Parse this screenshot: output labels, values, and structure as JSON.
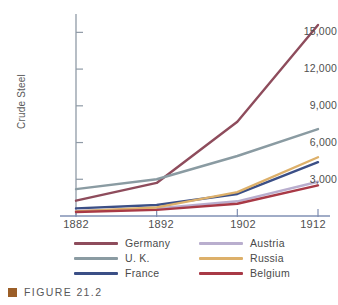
{
  "figure": {
    "caption": "FIGURE 21.2",
    "bullet_color": "#9b5e28"
  },
  "chart_data": {
    "type": "line",
    "title": "",
    "xlabel": "",
    "ylabel": "Crude Steel",
    "x": [
      1882,
      1892,
      1902,
      1912
    ],
    "categories": [
      "1882",
      "1892",
      "1902",
      "1912"
    ],
    "xtick_labels": [
      "1882",
      "1892",
      "1902",
      "1912"
    ],
    "ytick_labels": [
      "3,000",
      "6,000",
      "9,000",
      "12,000",
      "15,000"
    ],
    "ytick_values": [
      3000,
      6000,
      9000,
      12000,
      15000
    ],
    "ylim": [
      0,
      16500
    ],
    "xlim": [
      1882,
      1912
    ],
    "grid": false,
    "legend_position": "below",
    "series": [
      {
        "name": "Germany",
        "color": "#8e4c5c",
        "values": [
          1250,
          2700,
          7700,
          15600
        ]
      },
      {
        "name": "U. K.",
        "color": "#8a9ba2",
        "values": [
          2200,
          3000,
          4900,
          7100
        ]
      },
      {
        "name": "France",
        "color": "#3b4f86",
        "values": [
          620,
          900,
          1800,
          4400
        ]
      },
      {
        "name": "Austria",
        "color": "#b9aece",
        "values": [
          420,
          620,
          1200,
          2800
        ]
      },
      {
        "name": "Russia",
        "color": "#ddb06a",
        "values": [
          380,
          700,
          1950,
          4800
        ]
      },
      {
        "name": "Belgium",
        "color": "#a83946",
        "values": [
          330,
          500,
          1000,
          2500
        ]
      }
    ]
  },
  "legend": {
    "left_column": [
      {
        "label": "Germany",
        "color": "#8e4c5c"
      },
      {
        "label": "U. K.",
        "color": "#8a9ba2"
      },
      {
        "label": "France",
        "color": "#3b4f86"
      }
    ],
    "right_column": [
      {
        "label": "Austria",
        "color": "#b9aece"
      },
      {
        "label": "Russia",
        "color": "#ddb06a"
      },
      {
        "label": "Belgium",
        "color": "#a83946"
      }
    ]
  },
  "axes": {
    "axis_color": "#8f9aa6"
  }
}
